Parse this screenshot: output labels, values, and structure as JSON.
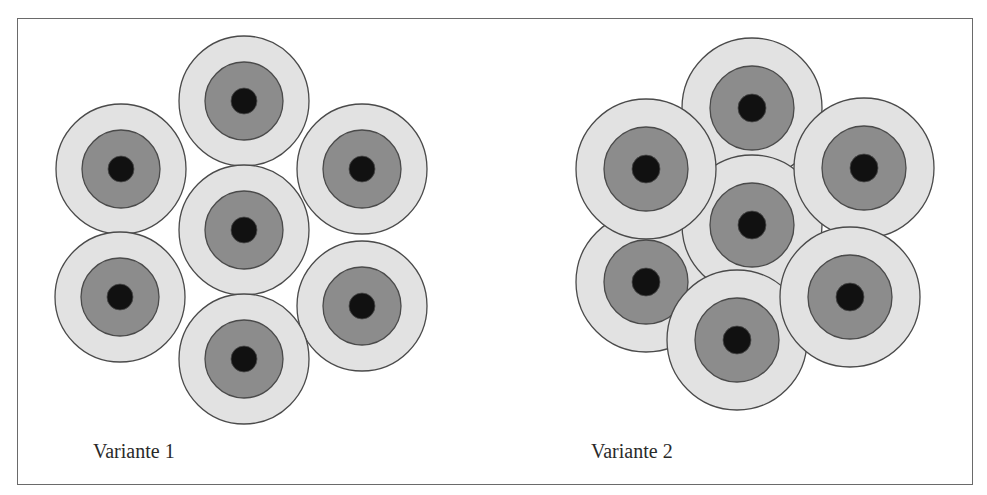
{
  "colors": {
    "outer_ring": "#e2e2e2",
    "middle_ring": "#8c8c8c",
    "core": "#111111",
    "stroke": "#4a4a4a",
    "frame": "#6a6a6a"
  },
  "variants": [
    {
      "label": "Variante 1",
      "label_pos": {
        "x": 93,
        "y": 440
      },
      "radii": {
        "outer": 65,
        "middle": 39,
        "core": 13
      },
      "circles": [
        {
          "name": "top",
          "cx": 244,
          "cy": 101
        },
        {
          "name": "upper-left",
          "cx": 121,
          "cy": 169
        },
        {
          "name": "upper-right",
          "cx": 362,
          "cy": 169
        },
        {
          "name": "center",
          "cx": 244,
          "cy": 230
        },
        {
          "name": "lower-left",
          "cx": 120,
          "cy": 297
        },
        {
          "name": "lower-right",
          "cx": 362,
          "cy": 306
        },
        {
          "name": "bottom",
          "cx": 244,
          "cy": 359
        }
      ]
    },
    {
      "label": "Variante 2",
      "label_pos": {
        "x": 591,
        "y": 440
      },
      "radii": {
        "outer": 70,
        "middle": 42,
        "core": 14
      },
      "circles": [
        {
          "name": "top",
          "cx": 752,
          "cy": 108
        },
        {
          "name": "lower-left",
          "cx": 646,
          "cy": 282
        },
        {
          "name": "center",
          "cx": 752,
          "cy": 225
        },
        {
          "name": "upper-left",
          "cx": 646,
          "cy": 169
        },
        {
          "name": "upper-right",
          "cx": 864,
          "cy": 168
        },
        {
          "name": "bottom",
          "cx": 737,
          "cy": 340
        },
        {
          "name": "lower-right",
          "cx": 850,
          "cy": 297
        }
      ]
    }
  ]
}
